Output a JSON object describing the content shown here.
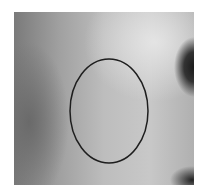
{
  "image": {
    "description": "grayscale skin texture photograph",
    "ellipse": {
      "cx": 109,
      "cy": 111,
      "rx": 39,
      "ry": 52,
      "stroke": "#1e1e1e"
    }
  }
}
